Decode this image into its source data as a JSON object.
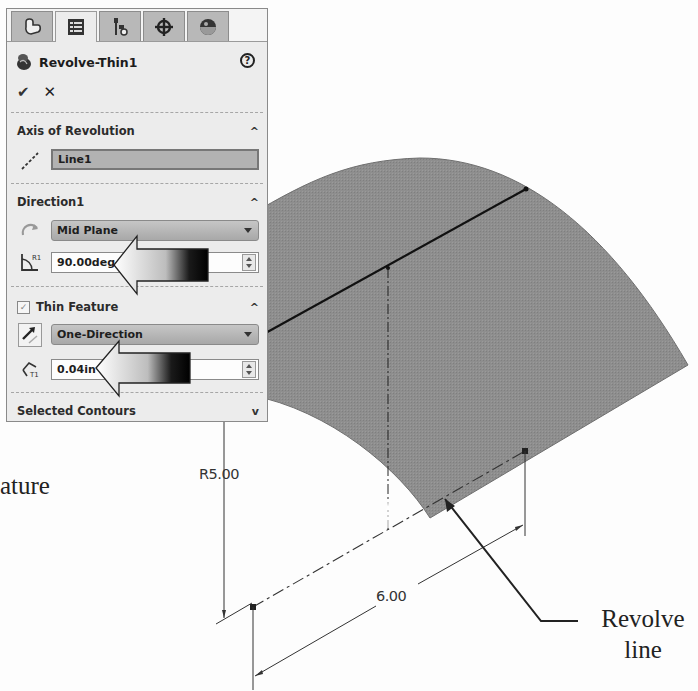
{
  "property_manager": {
    "tabs": [
      {
        "name": "FeatureManager",
        "icon": "feature-manager-icon",
        "active": false
      },
      {
        "name": "PropertyManager",
        "icon": "property-manager-icon",
        "active": true
      },
      {
        "name": "ConfigurationManager",
        "icon": "configuration-manager-icon",
        "active": false
      },
      {
        "name": "DimXpertManager",
        "icon": "dimxpert-icon",
        "active": false
      },
      {
        "name": "DisplayManager",
        "icon": "display-manager-icon",
        "active": false
      }
    ],
    "title": "Revolve-Thin1",
    "help_label": "?",
    "ok_label": "✔",
    "cancel_label": "✕",
    "sections": {
      "axis": {
        "header": "Axis of Revolution",
        "collapse_glyph": "^",
        "field_value": "Line1"
      },
      "direction1": {
        "header": "Direction1",
        "collapse_glyph": "^",
        "end_condition": "Mid Plane",
        "angle_value": "90.00deg"
      },
      "thin_feature": {
        "header": "Thin Feature",
        "checked": true,
        "collapse_glyph": "^",
        "type": "One-Direction",
        "thickness_value": "0.04in"
      },
      "selected_contours": {
        "header": "Selected Contours",
        "collapse_glyph": "v"
      }
    }
  },
  "graphics": {
    "surface_color": "#8c8c8c",
    "dimensions": {
      "radius": "R5.00",
      "length": "6.00"
    },
    "callouts": {
      "revolve_line_l1": "Revolve",
      "revolve_line_l2": "line",
      "partial_text": "ature"
    }
  }
}
